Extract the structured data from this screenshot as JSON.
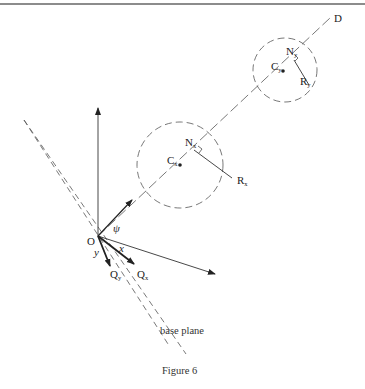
{
  "figure": {
    "caption": "Figure 6",
    "base_plane_label": "base plane"
  },
  "labels": {
    "D": "D",
    "origin": "O",
    "psi": "ψ",
    "x_axis": "x",
    "y_axis": "y",
    "Qx": {
      "main": "Q",
      "sub": "x"
    },
    "Qy": {
      "main": "Q",
      "sub": "y"
    },
    "Cx": {
      "main": "C",
      "sub": "x"
    },
    "Nx": {
      "main": "N",
      "sub": "x"
    },
    "Rx": {
      "main": "R",
      "sub": "x"
    },
    "Cy": {
      "main": "C",
      "sub": "y"
    },
    "Ny": {
      "main": "N",
      "sub": "y"
    },
    "Ry": {
      "main": "R",
      "sub": "y"
    }
  },
  "colors": {
    "line": "#333333",
    "dashed": "#555555",
    "rule": "#555555"
  }
}
